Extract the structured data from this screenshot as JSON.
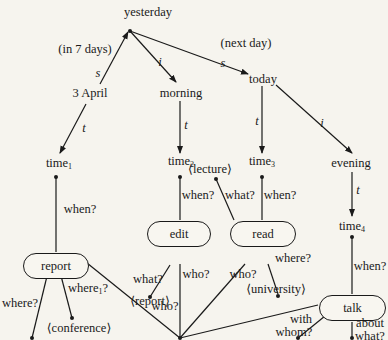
{
  "nodes": {
    "yesterday": "yesterday",
    "april": "3 April",
    "morning": "morning",
    "today": "today",
    "evening": "evening",
    "time1": "time",
    "time1_sub": "1",
    "time2": "time",
    "time2_sub": "2",
    "time3": "time",
    "time3_sub": "3",
    "time4": "time",
    "time4_sub": "4",
    "report": "report",
    "edit": "edit",
    "read": "read",
    "talk": "talk",
    "lecture": "⟨lecture⟩",
    "report_obj": "⟨report⟩",
    "conference": "⟨conference⟩",
    "university": "⟨university⟩"
  },
  "edge_labels": {
    "in7days": "(in 7 days)",
    "nextday": "(next day)",
    "s1": "s",
    "s2": "s",
    "i1": "i",
    "i2": "i",
    "t1": "t",
    "t2": "t",
    "t3": "t",
    "t4": "t",
    "when1": "when?",
    "when2": "when?",
    "when3": "when?",
    "when4": "when?",
    "what_edit": "what?",
    "what_read": "what?",
    "where_report": "where?",
    "where1_report": "where",
    "where1_sub": "1",
    "where1_q": "?",
    "where_read": "where?",
    "who_report": "who?",
    "who_edit": "who?",
    "who_read": "who?",
    "with": "with",
    "whom": "whom?",
    "about": "about",
    "about_what": "what?"
  }
}
